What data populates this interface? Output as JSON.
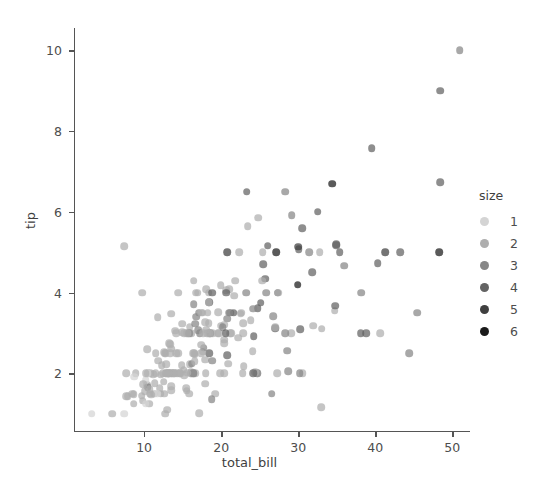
{
  "chart_data": {
    "type": "scatter",
    "title": "",
    "xlabel": "total_bill",
    "ylabel": "tip",
    "xlim": [
      0.9,
      52.3
    ],
    "ylim": [
      0.55,
      10.55
    ],
    "xticks": [
      10,
      20,
      30,
      40,
      50
    ],
    "yticks": [
      2,
      4,
      6,
      8,
      10
    ],
    "grid": false,
    "legend": {
      "title": "size",
      "position": "right",
      "entries": [
        {
          "label": "1",
          "color": "#d4d4d4"
        },
        {
          "label": "2",
          "color": "#aeaeae"
        },
        {
          "label": "3",
          "color": "#878787"
        },
        {
          "label": "4",
          "color": "#636363"
        },
        {
          "label": "5",
          "color": "#3f3f3f"
        },
        {
          "label": "6",
          "color": "#1a1a1a"
        }
      ]
    },
    "hue": "size",
    "marker_opacity": 0.72,
    "marker_size_px": 7.6,
    "series": [
      {
        "name": "tips",
        "x": [
          16.99,
          10.34,
          21.01,
          23.68,
          24.59,
          25.29,
          8.77,
          26.88,
          15.04,
          14.78,
          10.27,
          35.26,
          15.42,
          18.43,
          14.83,
          21.58,
          10.33,
          16.29,
          16.97,
          20.65,
          17.92,
          20.29,
          15.77,
          39.42,
          19.82,
          17.81,
          13.37,
          12.69,
          21.7,
          19.65,
          9.55,
          18.35,
          15.06,
          20.69,
          17.78,
          24.06,
          16.31,
          16.93,
          18.69,
          31.27,
          16.04,
          17.46,
          13.94,
          9.68,
          30.4,
          18.29,
          22.23,
          32.4,
          28.55,
          18.04,
          12.54,
          10.29,
          34.81,
          9.94,
          25.56,
          19.49,
          38.01,
          26.41,
          11.24,
          48.27,
          20.29,
          13.81,
          11.02,
          18.29,
          17.59,
          20.08,
          16.45,
          3.07,
          20.23,
          15.01,
          12.02,
          17.07,
          26.86,
          25.28,
          14.73,
          10.51,
          17.92,
          27.2,
          22.76,
          17.29,
          19.44,
          16.66,
          10.07,
          32.68,
          15.98,
          34.83,
          13.03,
          18.28,
          24.71,
          21.16,
          28.97,
          22.49,
          5.75,
          16.32,
          22.75,
          40.17,
          27.28,
          12.03,
          21.01,
          12.46,
          11.35,
          15.38,
          44.3,
          22.42,
          20.92,
          15.36,
          20.49,
          25.21,
          18.24,
          14.31,
          14.0,
          7.25,
          38.07,
          23.95,
          25.71,
          17.31,
          29.93,
          10.65,
          12.43,
          24.08,
          11.69,
          13.42,
          14.26,
          15.95,
          12.48,
          29.8,
          8.52,
          14.52,
          11.38,
          22.82,
          19.08,
          20.27,
          11.17,
          12.26,
          18.26,
          8.51,
          10.33,
          14.15,
          16.0,
          13.16,
          17.47,
          34.3,
          41.19,
          27.05,
          16.43,
          8.35,
          18.64,
          11.87,
          9.78,
          7.51,
          14.07,
          13.13,
          17.26,
          24.55,
          19.77,
          29.85,
          48.17,
          25.0,
          13.39,
          16.49,
          21.5,
          12.66,
          16.21,
          13.81,
          17.51,
          24.52,
          20.76,
          31.71,
          10.59,
          10.63,
          50.81,
          15.81,
          7.25,
          31.85,
          16.82,
          32.9,
          17.89,
          14.48,
          9.6,
          34.63,
          34.65,
          23.33,
          45.35,
          23.17,
          40.55,
          20.69,
          20.9,
          30.46,
          18.15,
          23.1,
          15.69,
          19.81,
          28.44,
          15.48,
          16.58,
          7.56,
          10.34,
          43.11,
          13.0,
          13.51,
          18.71,
          12.74,
          13.0,
          16.4,
          20.53,
          16.47,
          26.59,
          38.73,
          24.27,
          12.76,
          30.06,
          25.89,
          48.33,
          13.27,
          28.17,
          12.9,
          28.15,
          11.59,
          7.74,
          30.14,
          12.16,
          13.42,
          8.58,
          15.98,
          13.42,
          16.27,
          10.09,
          20.45,
          13.28,
          22.12,
          24.01,
          15.69,
          11.61,
          10.77,
          15.53,
          10.07,
          12.6,
          32.83,
          35.83,
          29.03,
          27.18,
          22.67,
          17.82,
          18.78
        ],
        "y": [
          1.01,
          1.66,
          3.5,
          3.31,
          3.61,
          4.71,
          2.0,
          3.12,
          1.96,
          3.23,
          1.71,
          5.0,
          1.57,
          3.0,
          3.02,
          3.92,
          1.67,
          3.71,
          3.5,
          3.35,
          4.08,
          2.75,
          2.23,
          7.58,
          3.18,
          2.34,
          2.0,
          2.0,
          4.3,
          3.0,
          1.45,
          2.5,
          3.0,
          2.45,
          3.27,
          3.6,
          2.0,
          3.07,
          2.31,
          5.0,
          2.24,
          2.54,
          3.06,
          1.32,
          5.6,
          3.0,
          5.0,
          6.0,
          2.05,
          3.0,
          2.5,
          2.6,
          5.2,
          1.56,
          4.34,
          3.51,
          3.0,
          1.5,
          1.76,
          6.73,
          3.21,
          2.0,
          1.98,
          3.76,
          2.64,
          3.15,
          2.47,
          1.0,
          2.01,
          2.09,
          1.97,
          3.0,
          3.14,
          5.0,
          2.2,
          1.25,
          3.08,
          4.0,
          3.0,
          2.71,
          3.0,
          3.4,
          1.83,
          5.0,
          2.03,
          5.17,
          2.0,
          4.0,
          5.85,
          3.0,
          3.0,
          3.5,
          1.0,
          4.3,
          3.25,
          4.73,
          4.0,
          1.5,
          3.0,
          1.5,
          2.5,
          3.0,
          2.5,
          3.48,
          4.08,
          1.64,
          4.06,
          4.29,
          3.76,
          4.0,
          3.0,
          1.0,
          4.0,
          2.55,
          4.0,
          3.5,
          5.07,
          1.5,
          1.8,
          2.92,
          2.31,
          1.68,
          2.5,
          2.0,
          2.52,
          4.2,
          1.48,
          2.0,
          2.0,
          2.18,
          1.5,
          2.83,
          1.5,
          2.0,
          3.25,
          1.25,
          2.0,
          2.0,
          2.0,
          2.75,
          3.5,
          6.7,
          5.0,
          5.0,
          2.3,
          1.5,
          1.36,
          1.63,
          1.73,
          2.0,
          2.5,
          2.0,
          2.5,
          2.0,
          2.0,
          5.14,
          5.0,
          3.75,
          2.61,
          2.0,
          3.5,
          2.5,
          2.0,
          2.0,
          3.0,
          2.0,
          2.24,
          4.5,
          1.61,
          2.0,
          10.0,
          3.16,
          5.15,
          3.18,
          4.0,
          3.11,
          2.0,
          2.0,
          4.0,
          3.55,
          3.68,
          5.65,
          3.5,
          6.5,
          3.0,
          5.0,
          3.5,
          2.0,
          3.5,
          4.0,
          1.5,
          4.19,
          2.56,
          2.02,
          4.0,
          1.44,
          2.0,
          5.0,
          2.0,
          2.0,
          4.0,
          2.0,
          2.0,
          2.5,
          4.0,
          3.23,
          3.41,
          3.0,
          2.03,
          2.23,
          2.0,
          5.16,
          9.0,
          2.5,
          6.5,
          1.1,
          3.0,
          1.5,
          1.44,
          3.09,
          2.2,
          3.48,
          1.92,
          3.0,
          1.58,
          2.5,
          2.0,
          3.0,
          2.72,
          2.88,
          2.0,
          3.0,
          3.39,
          1.47,
          3.0,
          1.25,
          1.0,
          1.17,
          4.67,
          5.92,
          2.0,
          2.0,
          1.75,
          3.0
        ],
        "size": [
          2,
          3,
          3,
          2,
          4,
          4,
          2,
          4,
          2,
          2,
          2,
          4,
          2,
          4,
          2,
          2,
          3,
          3,
          3,
          3,
          2,
          2,
          2,
          4,
          2,
          2,
          2,
          2,
          2,
          2,
          2,
          4,
          2,
          4,
          2,
          3,
          3,
          3,
          3,
          3,
          3,
          2,
          2,
          2,
          4,
          2,
          2,
          4,
          3,
          2,
          2,
          2,
          4,
          2,
          4,
          2,
          4,
          3,
          2,
          4,
          2,
          2,
          2,
          4,
          3,
          3,
          2,
          1,
          2,
          2,
          2,
          3,
          2,
          2,
          2,
          2,
          2,
          4,
          2,
          2,
          2,
          3,
          1,
          2,
          2,
          4,
          2,
          2,
          2,
          2,
          2,
          2,
          2,
          2,
          2,
          4,
          2,
          2,
          2,
          2,
          2,
          2,
          3,
          2,
          2,
          2,
          2,
          2,
          2,
          2,
          2,
          1,
          3,
          2,
          3,
          2,
          4,
          2,
          2,
          4,
          2,
          2,
          2,
          2,
          2,
          6,
          2,
          2,
          2,
          2,
          2,
          2,
          2,
          2,
          2,
          2,
          2,
          2,
          2,
          2,
          2,
          6,
          5,
          6,
          2,
          2,
          3,
          2,
          2,
          2,
          2,
          2,
          2,
          2,
          2,
          5,
          6,
          4,
          2,
          2,
          4,
          2,
          3,
          2,
          2,
          3,
          2,
          4,
          2,
          2,
          3,
          2,
          2,
          2,
          2,
          2,
          2,
          2,
          2,
          2,
          4,
          2,
          3,
          4,
          2,
          5,
          3,
          2,
          2,
          3,
          2,
          2,
          3,
          2,
          2,
          2,
          1,
          4,
          2,
          2,
          4,
          2,
          2,
          2,
          4,
          3,
          3,
          4,
          2,
          2,
          3,
          4,
          4,
          2,
          3,
          2,
          3,
          1,
          2,
          4,
          2,
          2,
          1,
          2,
          2,
          2,
          2,
          4,
          2,
          2,
          4,
          3,
          2,
          2,
          2,
          1,
          2,
          2,
          3,
          3,
          2,
          2,
          2,
          2
        ]
      }
    ]
  }
}
